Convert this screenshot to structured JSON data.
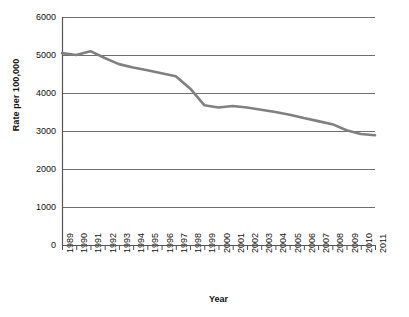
{
  "chart_data": {
    "type": "line",
    "title": "",
    "xlabel": "Year",
    "ylabel": "Rate per 100,000",
    "x": [
      1989,
      1990,
      1991,
      1992,
      1993,
      1994,
      1995,
      1996,
      1997,
      1998,
      1999,
      2000,
      2001,
      2002,
      2003,
      2004,
      2005,
      2006,
      2007,
      2008,
      2009,
      2010,
      2011
    ],
    "categories": [
      "1989",
      "1990",
      "1991",
      "1992",
      "1993",
      "1994",
      "1995",
      "1996",
      "1997",
      "1998",
      "1999",
      "2000",
      "2001",
      "2002",
      "2003",
      "2004",
      "2005",
      "2006",
      "2007",
      "2008",
      "2009",
      "2010",
      "2011"
    ],
    "values": [
      5050,
      5000,
      5100,
      4920,
      4760,
      4670,
      4600,
      4520,
      4440,
      4120,
      3680,
      3620,
      3660,
      3620,
      3560,
      3500,
      3430,
      3340,
      3260,
      3180,
      3020,
      2920,
      2890
    ],
    "series": [
      {
        "name": "Rate per 100,000",
        "values": [
          5050,
          5000,
          5100,
          4920,
          4760,
          4670,
          4600,
          4520,
          4440,
          4120,
          3680,
          3620,
          3660,
          3620,
          3560,
          3500,
          3430,
          3340,
          3260,
          3180,
          3020,
          2920,
          2890
        ],
        "color": "#808080"
      }
    ],
    "ylim": [
      0,
      6000
    ],
    "yticks": [
      0,
      1000,
      2000,
      3000,
      4000,
      5000,
      6000
    ],
    "ytick_labels": [
      "0",
      "1000",
      "2000",
      "3000",
      "4000",
      "5000",
      "6000"
    ],
    "grid": true,
    "grid_axis": "y",
    "legend": "none",
    "line_color": "#808080",
    "grid_color": "#6f6f6f",
    "axis_color": "#555555"
  }
}
